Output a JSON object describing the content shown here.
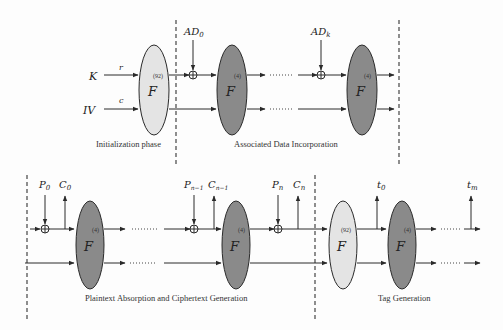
{
  "colors": {
    "background": "#fdfdfd",
    "ellipse_light": "#e4e4e4",
    "ellipse_dark": "#8a8a8a",
    "stroke": "#2a2a2a"
  },
  "top_row": {
    "inputs": {
      "key_label": "K",
      "iv_label": "IV",
      "rate_label": "r",
      "capacity_label": "c"
    },
    "init_permutation": {
      "label": "F",
      "rounds": "(92)",
      "style": "light"
    },
    "ad_labels": {
      "first": "AD",
      "first_sub": "0",
      "last": "AD",
      "last_sub": "k"
    },
    "ad_permutations": [
      {
        "label": "F",
        "rounds": "(4)",
        "style": "dark"
      },
      {
        "label": "F",
        "rounds": "(4)",
        "style": "dark"
      }
    ],
    "captions": {
      "initialization": "Initialization phase",
      "associated_data": "Associated Data Incorporation"
    }
  },
  "bottom_row": {
    "io_labels": {
      "p0": "P",
      "p0_sub": "0",
      "c0": "C",
      "c0_sub": "0",
      "pn1": "P",
      "pn1_sub": "n−1",
      "cn1": "C",
      "cn1_sub": "n−1",
      "pn": "P",
      "pn_sub": "n",
      "cn": "C",
      "cn_sub": "n",
      "t0": "t",
      "t0_sub": "0",
      "tm": "t",
      "tm_sub": "m"
    },
    "encrypt_permutations": [
      {
        "label": "F",
        "rounds": "(4)",
        "style": "dark"
      },
      {
        "label": "F",
        "rounds": "(4)",
        "style": "dark"
      }
    ],
    "final_permutation": {
      "label": "F",
      "rounds": "(92)",
      "style": "light"
    },
    "tag_permutation": {
      "label": "F",
      "rounds": "(4)",
      "style": "dark"
    },
    "captions": {
      "encryption": "Plaintext Absorption and Ciphertext Generation",
      "tag": "Tag Generation"
    }
  }
}
